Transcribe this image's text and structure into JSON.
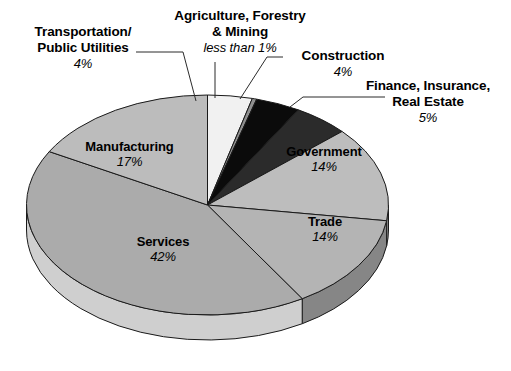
{
  "chart_data": {
    "type": "pie",
    "title": "",
    "subtitle": "",
    "xlabel": "",
    "ylabel": "",
    "legend_position": "none",
    "grid": false,
    "three_d": true,
    "start_angle_deg": 0,
    "direction": "clockwise",
    "categories": [
      "Transportation/Public Utilities",
      "Agriculture, Forestry & Mining",
      "Construction",
      "Finance, Insurance, Real Estate",
      "Government",
      "Trade",
      "Services",
      "Manufacturing"
    ],
    "values": [
      4,
      0.4,
      4,
      5,
      14,
      14,
      42,
      17
    ],
    "value_labels": [
      "4%",
      "less than 1%",
      "4%",
      "5%",
      "14%",
      "14%",
      "42%",
      "17%"
    ],
    "slices": [
      {
        "id": "transportation",
        "label_line1": "Transportation/",
        "label_line2": "Public Utilities",
        "value_label": "4%",
        "value": 4,
        "color": "#f1f1f1",
        "side_color": "#d6d6d6",
        "placement": "callout"
      },
      {
        "id": "agriculture",
        "label_line1": "Agriculture, Forestry",
        "label_line2": "& Mining",
        "value_label": "less than 1%",
        "value": 0.4,
        "color": "#8f8f8f",
        "side_color": "#6f6f6f",
        "placement": "callout"
      },
      {
        "id": "construction",
        "label_line1": "Construction",
        "label_line2": "",
        "value_label": "4%",
        "value": 4,
        "color": "#0b0b0b",
        "side_color": "#050505",
        "placement": "callout"
      },
      {
        "id": "finance",
        "label_line1": "Finance, Insurance,",
        "label_line2": "Real Estate",
        "value_label": "5%",
        "value": 5,
        "color": "#2b2b2b",
        "side_color": "#1c1c1c",
        "placement": "callout"
      },
      {
        "id": "government",
        "label_line1": "Government",
        "label_line2": "",
        "value_label": "14%",
        "value": 14,
        "color": "#bdbdbd",
        "side_color": "#9a9a9a",
        "placement": "inside"
      },
      {
        "id": "trade",
        "label_line1": "Trade",
        "label_line2": "",
        "value_label": "14%",
        "value": 14,
        "color": "#b4b4b4",
        "side_color": "#868686",
        "placement": "inside"
      },
      {
        "id": "services",
        "label_line1": "Services",
        "label_line2": "",
        "value_label": "42%",
        "value": 42,
        "color": "#ababab",
        "side_color": "#cfcfcf",
        "placement": "inside"
      },
      {
        "id": "manufacturing",
        "label_line1": "Manufacturing",
        "label_line2": "",
        "value_label": "17%",
        "value": 17,
        "color": "#bcbcbc",
        "side_color": "#d2d2d2",
        "placement": "inside"
      }
    ],
    "colors": {
      "background": "#ffffff",
      "text": "#000000",
      "outline": "#1a1a1a",
      "leader_line": "#2b2b2b"
    }
  }
}
